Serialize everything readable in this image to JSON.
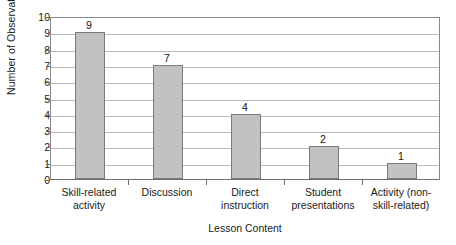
{
  "chart_data": {
    "type": "bar",
    "title": "",
    "xlabel": "Lesson Content",
    "ylabel": "Number of Observations",
    "categories": [
      "Skill-related activity",
      "Discussion",
      "Direct instruction",
      "Student presentations",
      "Activity (non-skill-related)"
    ],
    "category_lines": [
      [
        "Skill-related",
        "activity"
      ],
      [
        "Discussion",
        ""
      ],
      [
        "Direct",
        "instruction"
      ],
      [
        "Student",
        "presentations"
      ],
      [
        "Activity (non-",
        "skill-related)"
      ]
    ],
    "values": [
      9,
      7,
      4,
      2,
      1
    ],
    "value_labels": [
      "9",
      "7",
      "4",
      "2",
      "1"
    ],
    "ylim": [
      0,
      10
    ],
    "ytick_labels": [
      "10",
      "9",
      "8",
      "7",
      "6",
      "5",
      "4",
      "3",
      "2",
      "1",
      "0"
    ],
    "ytick_values": [
      10,
      9,
      8,
      7,
      6,
      5,
      4,
      3,
      2,
      1,
      0
    ],
    "grid": true,
    "legend": false,
    "bar_color": "#c2c2c2",
    "bar_border_color": "#7a7a7a",
    "grid_color": "#b9b9b9",
    "axis_color": "#6e6e6e",
    "background_color": "#ffffff"
  }
}
